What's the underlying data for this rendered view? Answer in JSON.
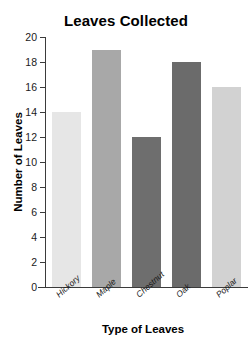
{
  "chart_data": {
    "type": "bar",
    "title": "Leaves Collected",
    "xlabel": "Type of Leaves",
    "ylabel": "Number of Leaves",
    "categories": [
      "Hickory",
      "Maple",
      "Chestnut",
      "Oak",
      "Poplar"
    ],
    "values": [
      14,
      19,
      12,
      18,
      16
    ],
    "bar_colors": [
      "#e6e6e6",
      "#a8a8a8",
      "#6e6e6e",
      "#6b6b6b",
      "#d2d2d2"
    ],
    "ylim": [
      0,
      20
    ],
    "ytick_step": 2,
    "yticks": [
      0,
      2,
      4,
      6,
      8,
      10,
      12,
      14,
      16,
      18,
      20
    ],
    "ytick_labels": [
      "0",
      "2",
      "4",
      "6",
      "8",
      "10",
      "12",
      "14",
      "16",
      "18",
      "20"
    ],
    "grid": false,
    "legend": false,
    "axis_color": "#3b3b3b",
    "background": "#ffffff"
  }
}
